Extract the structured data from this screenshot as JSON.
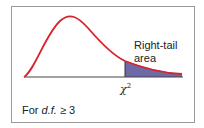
{
  "diagram": {
    "colors": {
      "curve": "#d8232a",
      "shaded_area": "#6e6aa8",
      "axis": "#444444",
      "frame": "#9a9a9a"
    },
    "labels": {
      "right_tail_line1": "Right-tail",
      "right_tail_line2": "area",
      "critical_value": "χ",
      "critical_value_sup": "2",
      "condition_prefix": "For ",
      "condition_df": "d.f.",
      "condition_suffix": " ≥ 3"
    }
  }
}
